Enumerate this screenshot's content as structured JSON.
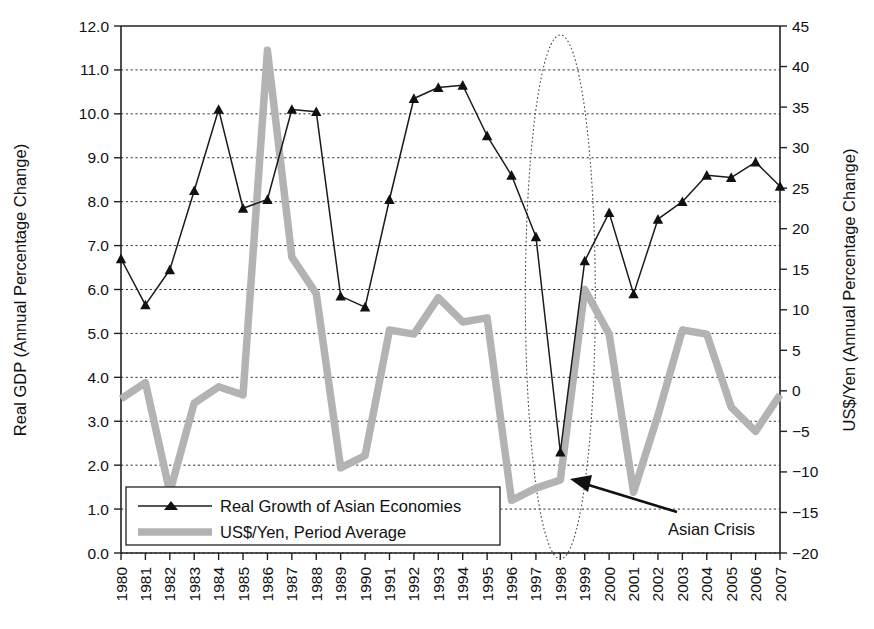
{
  "chart_data": {
    "type": "line",
    "title": "",
    "xlabel": "",
    "ylabel": "Real GDP (Annual Percentage Change)",
    "y2label": "US$/Yen (Annual Percentage Change)",
    "grid": true,
    "legend_position": "bottom-left",
    "ylim": [
      0.0,
      12.0
    ],
    "ytick_step": 1.0,
    "y2lim": [
      -20,
      45
    ],
    "y2tick_step": 5,
    "categories": [
      "1980",
      "1981",
      "1982",
      "1983",
      "1984",
      "1985",
      "1986",
      "1987",
      "1988",
      "1989",
      "1990",
      "1991",
      "1992",
      "1993",
      "1994",
      "1995",
      "1996",
      "1997",
      "1998",
      "1999",
      "2000",
      "2001",
      "2002",
      "2003",
      "2004",
      "2005",
      "2006",
      "2007"
    ],
    "ytick_labels": [
      "0.0",
      "1.0",
      "2.0",
      "3.0",
      "4.0",
      "5.0",
      "6.0",
      "7.0",
      "8.0",
      "9.0",
      "10.0",
      "11.0",
      "12.0"
    ],
    "y2tick_labels": [
      "-20",
      "-15",
      "-10",
      "-5",
      "0",
      "5",
      "10",
      "15",
      "20",
      "25",
      "30",
      "35",
      "40",
      "45"
    ],
    "series": [
      {
        "name": "Real Growth of Asian Economies",
        "axis": "left",
        "color": "#1b1b1b",
        "marker": "triangle",
        "values": [
          6.7,
          5.65,
          6.45,
          8.25,
          10.1,
          7.85,
          8.05,
          10.1,
          10.05,
          5.85,
          5.6,
          8.05,
          10.35,
          10.6,
          10.65,
          9.5,
          8.6,
          7.2,
          2.3,
          6.65,
          7.75,
          5.9,
          7.6,
          8.0,
          8.6,
          8.55,
          8.9,
          8.35
        ]
      },
      {
        "name": "US$/Yen, Period Average",
        "axis": "right",
        "color": "#b3b3b3",
        "marker": "none",
        "values": [
          -1.0,
          1.0,
          -12.5,
          -1.5,
          0.5,
          -0.5,
          42.0,
          16.5,
          12.0,
          -9.5,
          -8.0,
          7.5,
          7.0,
          11.5,
          8.5,
          9.0,
          -13.5,
          -12.0,
          -11.0,
          12.5,
          7.0,
          -12.5,
          -3.0,
          7.5,
          7.0,
          -2.0,
          -5.0,
          -0.5
        ]
      }
    ],
    "annotations": [
      {
        "text": "Asian Crisis",
        "target_year": "1998",
        "kind": "arrow-label"
      },
      {
        "text": "",
        "kind": "ellipse-highlight",
        "target_year": "1998"
      }
    ]
  },
  "legend": {
    "items": [
      {
        "label": "Real Growth of Asian Economies",
        "style": "line-marker",
        "color": "#1b1b1b"
      },
      {
        "label": "US$/Yen, Period Average",
        "style": "thick-line",
        "color": "#b3b3b3"
      }
    ]
  }
}
